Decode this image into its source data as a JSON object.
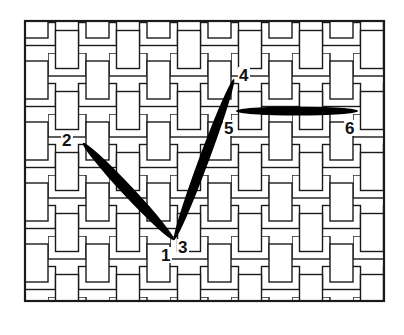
{
  "diagram": {
    "type": "needlepoint stitch diagram",
    "canvas": {
      "pattern": "basketweave",
      "frame": {
        "x": 25,
        "y": 21,
        "width": 359,
        "height": 280
      },
      "line_color": "#1a1a1a",
      "fill_color": "#ffffff",
      "tile_period": 61
    },
    "stitch_color": "#000000",
    "stitches": [
      {
        "from": "2",
        "to": "1",
        "x1": 83,
        "y1": 143,
        "x2": 174,
        "y2": 240,
        "thickness": 11
      },
      {
        "from": "3",
        "to": "4",
        "x1": 174,
        "y1": 240,
        "x2": 234,
        "y2": 79,
        "thickness": 10
      },
      {
        "from": "5",
        "to": "6",
        "x1": 236,
        "y1": 111,
        "x2": 358,
        "y2": 111,
        "thickness": 9
      }
    ],
    "labels": [
      {
        "text": "1",
        "x": 161,
        "y": 261
      },
      {
        "text": "2",
        "x": 62,
        "y": 146
      },
      {
        "text": "3",
        "x": 178,
        "y": 253
      },
      {
        "text": "4",
        "x": 239,
        "y": 81
      },
      {
        "text": "5",
        "x": 224,
        "y": 134
      },
      {
        "text": "6",
        "x": 345,
        "y": 134
      }
    ]
  },
  "caption_fragment": "..."
}
